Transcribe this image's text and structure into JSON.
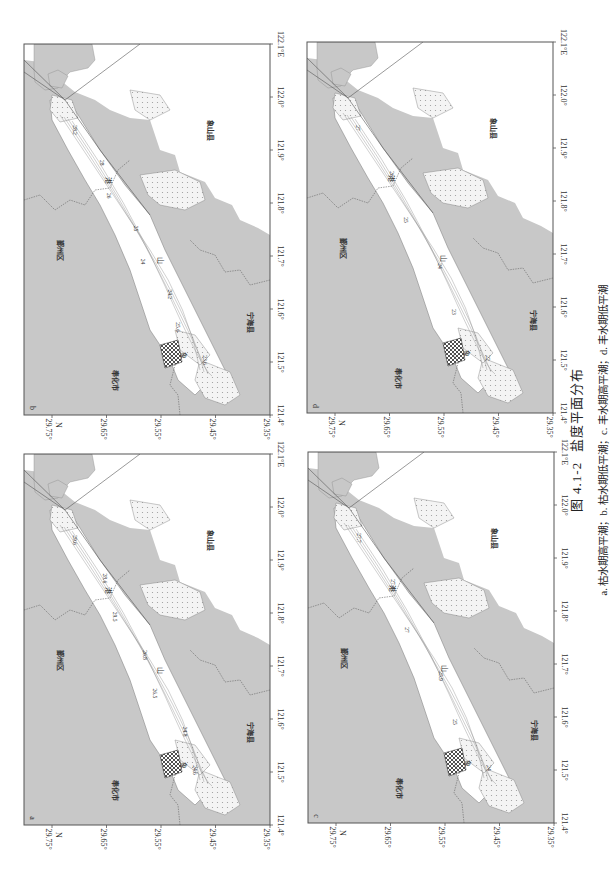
{
  "figure": {
    "number": "图 4.1-2",
    "title": "盐度平面分布",
    "subtitle": "a. 枯水期高平潮；b. 枯水期低平潮；c. 丰水期高平潮；d. 丰水期低平潮",
    "orientation": "rotated 90° clockwise"
  },
  "axes": {
    "lon_ticks": [
      "121.4°",
      "121.5°",
      "121.6°",
      "121.7°",
      "121.8°",
      "121.9°",
      "122.0°",
      "122.1°E"
    ],
    "lat_ticks": [
      "29.75°",
      "29.65°",
      "29.55°",
      "29.45°",
      "29.35°"
    ],
    "lat_unit": "N"
  },
  "places": {
    "yinzhou": "鄞州区",
    "fenghua": "奉化市",
    "xiangshan": "象山县",
    "ninghai": "宁海县",
    "gang": "港",
    "shan": "山",
    "xiang": "象"
  },
  "colors": {
    "land": "#c8c8c8",
    "water": "#ffffff",
    "tidal_flat_dots": "#999999",
    "frame": "#555555"
  },
  "panels": [
    {
      "id": "b",
      "label": "b",
      "description": "枯水期低平潮",
      "contours": [
        "28.2",
        "28",
        "26",
        "25",
        "24",
        "24.2",
        "25.6",
        "23.6"
      ]
    },
    {
      "id": "d",
      "label": "d",
      "description": "丰水期低平潮",
      "contours": [
        "27",
        "26",
        "25",
        "24",
        "23",
        "22"
      ]
    },
    {
      "id": "a",
      "label": "a",
      "description": "枯水期高平潮",
      "contours": [
        "29.6",
        "28.6",
        "29.5",
        "26.8",
        "26.5",
        "24.8",
        "24.6"
      ]
    },
    {
      "id": "c",
      "label": "c",
      "description": "丰水期高平潮",
      "contours": [
        "27.7",
        "27.4",
        "27",
        "25.9",
        "25",
        "24"
      ]
    }
  ]
}
